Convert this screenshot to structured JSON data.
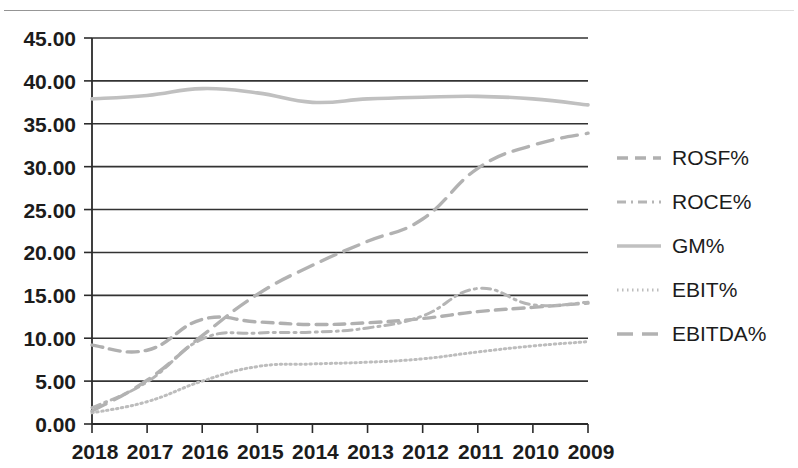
{
  "chart_data": {
    "type": "line",
    "title": "",
    "subtitle": "",
    "xlabel": "",
    "ylabel": "",
    "categories": [
      "2018",
      "2017",
      "2016",
      "2015",
      "2014",
      "2013",
      "2012",
      "2011",
      "2010",
      "2009"
    ],
    "x_tick_labels": [
      "2018",
      "2017",
      "2016",
      "2015",
      "2014",
      "2013",
      "2012",
      "2011",
      "2010",
      "2009"
    ],
    "y_tick_labels": [
      "0.00",
      "5.00",
      "10.00",
      "15.00",
      "20.00",
      "25.00",
      "30.00",
      "35.00",
      "40.00",
      "45.00"
    ],
    "y_tick_values": [
      0,
      5,
      10,
      15,
      20,
      25,
      30,
      35,
      40,
      45
    ],
    "ylim": [
      0,
      45
    ],
    "grid": "horizontal",
    "legend_position": "right",
    "series": [
      {
        "name": "ROSF%",
        "style": "dashed",
        "color": "#b0b0b0",
        "values": [
          9.2,
          8.6,
          12.2,
          11.9,
          11.6,
          11.8,
          12.3,
          13.1,
          13.6,
          14.1
        ]
      },
      {
        "name": "ROCE%",
        "style": "dash-dot",
        "color": "#b5b5b5",
        "values": [
          1.9,
          4.9,
          9.9,
          10.6,
          10.7,
          11.2,
          12.6,
          15.8,
          13.9,
          14.2
        ]
      },
      {
        "name": "GM%",
        "style": "solid",
        "color": "#c0c0c0",
        "values": [
          37.9,
          38.3,
          39.1,
          38.6,
          37.5,
          37.9,
          38.1,
          38.2,
          37.9,
          37.2
        ]
      },
      {
        "name": "EBIT%",
        "style": "dotted",
        "color": "#bdbdbd",
        "values": [
          1.3,
          2.6,
          5.0,
          6.7,
          7.0,
          7.2,
          7.6,
          8.4,
          9.1,
          9.6
        ]
      },
      {
        "name": "EBITDA%",
        "style": "long-dash",
        "color": "#b2b2b2",
        "values": [
          1.5,
          5.1,
          10.3,
          15.1,
          18.5,
          21.3,
          23.9,
          29.8,
          32.5,
          33.9
        ]
      }
    ]
  },
  "legend": {
    "entries": [
      {
        "label": "ROSF%"
      },
      {
        "label": "ROCE%"
      },
      {
        "label": "GM%"
      },
      {
        "label": "EBIT%"
      },
      {
        "label": "EBITDA%"
      }
    ]
  },
  "colors": {
    "axis": "#2b2b2b",
    "gridline": "#333333",
    "text": "#1c1c1c",
    "background": "#ffffff"
  }
}
